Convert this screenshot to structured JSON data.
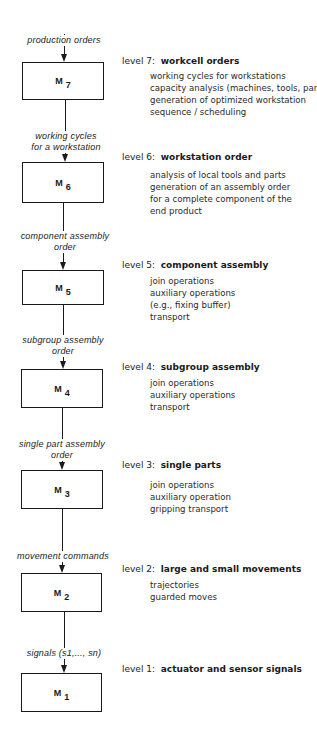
{
  "diagram": {
    "type": "hierarchical control levels",
    "levels": [
      {
        "module": "M",
        "sub": "7",
        "input_label": [
          "production orders"
        ],
        "level_label": "level 7:",
        "title": "workcell orders",
        "items": [
          "working cycles for workstations",
          "capacity analysis (machines, tools, part",
          "generation of optimized workstation",
          "sequence  / scheduling"
        ]
      },
      {
        "module": "M",
        "sub": "6",
        "input_label": [
          "working   cycles",
          "for  a  workstation"
        ],
        "level_label": "level 6:",
        "title": "workstation order",
        "items": [
          "analysis of local tools and parts",
          "generation of an assembly order",
          "for a complete component of the",
          "end product"
        ]
      },
      {
        "module": "M",
        "sub": "5",
        "input_label": [
          "component  assembly",
          "order"
        ],
        "level_label": "level 5:",
        "title": "component assembly",
        "items": [
          "join operations",
          "auxiliary operations",
          "(e.g., fixing buffer)",
          "transport"
        ]
      },
      {
        "module": "M",
        "sub": "4",
        "input_label": [
          "subgroup  assembly",
          "order"
        ],
        "level_label": "level 4:",
        "title": "subgroup assembly",
        "items": [
          "join operations",
          "auxiliary operations",
          "transport"
        ]
      },
      {
        "module": "M",
        "sub": "3",
        "input_label": [
          "single  part  assembly",
          "order"
        ],
        "level_label": "level 3:",
        "title": "single parts",
        "items": [
          "join operations",
          "auxiliary operation",
          "gripping transport"
        ]
      },
      {
        "module": "M",
        "sub": "2",
        "input_label": [
          "movement  commands"
        ],
        "level_label": "level 2:",
        "title": "large and small movements",
        "items": [
          "trajectories",
          "guarded moves"
        ]
      },
      {
        "module": "M",
        "sub": "1",
        "input_label": [
          "signals  (s1,...,  sn)"
        ],
        "level_label": "level 1:",
        "title": "actuator and sensor signals",
        "items": []
      }
    ]
  }
}
